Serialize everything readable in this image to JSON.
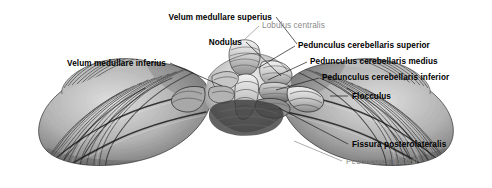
{
  "figure": {
    "view": "posterior-inferior",
    "style": "grayscale anatomical engraving",
    "background_color": "#ffffff",
    "label_bold_color": "#000000",
    "label_light_color": "#8a8a8a",
    "leader_line_color": "#1a1a1a",
    "width": 492,
    "height": 188
  },
  "labels": [
    {
      "id": "velum-medullare-superius",
      "text": "Velum medullare superius",
      "weight": "bold",
      "align": "right",
      "x": 272,
      "y": 13,
      "leader": [
        [
          276,
          17
        ],
        [
          297,
          44
        ]
      ]
    },
    {
      "id": "nodulus",
      "text": "Nodulus",
      "weight": "bold",
      "align": "right",
      "x": 242,
      "y": 38,
      "leader": [
        [
          246,
          42
        ],
        [
          281,
          76
        ]
      ]
    },
    {
      "id": "velum-medullare-inferius",
      "text": "Velum medullare inferius",
      "weight": "bold",
      "align": "right",
      "x": 166,
      "y": 59,
      "leader": [
        [
          170,
          63
        ],
        [
          222,
          86
        ]
      ]
    },
    {
      "id": "lobulus-centralis",
      "text": "Lobulus centralis",
      "weight": "light",
      "align": "left",
      "x": 262,
      "y": 21,
      "leader": [
        [
          259,
          26
        ],
        [
          244,
          40
        ]
      ]
    },
    {
      "id": "pedunculus-cerebellaris-superior",
      "text": "Pedunculus cerebellaris superior",
      "weight": "bold",
      "align": "left",
      "x": 298,
      "y": 41,
      "leader": [
        [
          295,
          46
        ],
        [
          258,
          68
        ]
      ]
    },
    {
      "id": "pedunculus-cerebellaris-medius",
      "text": "Pedunculus cerebellaris medius",
      "weight": "bold",
      "align": "left",
      "x": 310,
      "y": 57,
      "leader": [
        [
          307,
          62
        ],
        [
          268,
          80
        ]
      ]
    },
    {
      "id": "pedunculus-cerebellaris-inferior",
      "text": "Pedunculus cerebellaris inferior",
      "weight": "bold",
      "align": "left",
      "x": 322,
      "y": 73,
      "leader": [
        [
          319,
          78
        ],
        [
          276,
          90
        ]
      ]
    },
    {
      "id": "flocculus",
      "text": "Flocculus",
      "weight": "bold",
      "align": "left",
      "x": 352,
      "y": 93,
      "leader": [
        [
          348,
          97
        ],
        [
          330,
          97
        ]
      ]
    },
    {
      "id": "fissura-posterolateralis",
      "text": "Fissura posterolateralis",
      "weight": "bold",
      "align": "left",
      "x": 352,
      "y": 140,
      "leader": [
        [
          348,
          144
        ],
        [
          279,
          108
        ]
      ]
    },
    {
      "id": "pedunculus-flocculi",
      "text": "Pedunculus flocculi",
      "weight": "light",
      "align": "left",
      "x": 346,
      "y": 157,
      "leader": [
        [
          342,
          161
        ],
        [
          294,
          141
        ]
      ]
    }
  ]
}
